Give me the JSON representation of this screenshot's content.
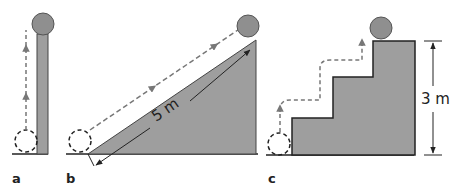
{
  "figure": {
    "panels": [
      {
        "id": "a",
        "label": "a",
        "description": "Ball lifted vertically beside a thin column"
      },
      {
        "id": "b",
        "label": "b",
        "description": "Ball rolled up an inclined ramp",
        "dimension": "5 m"
      },
      {
        "id": "c",
        "label": "c",
        "description": "Ball carried up a staircase",
        "dimension": "3 m"
      }
    ]
  },
  "colors": {
    "fill": "#9e9e9e",
    "ball": "#8f8f8f",
    "stroke": "#222222",
    "path": "#777777"
  }
}
